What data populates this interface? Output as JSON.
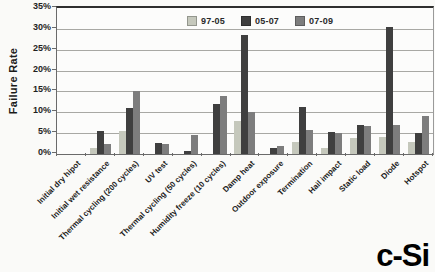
{
  "figure": {
    "corner_label": "c-Si"
  },
  "chart_data": {
    "type": "bar",
    "title": "",
    "xlabel": "",
    "ylabel": "Failure Rate",
    "ylim": [
      0,
      35
    ],
    "ytick_step": 5,
    "ytick_suffix": "%",
    "grid": true,
    "legend_position": "top-center-inside",
    "categories": [
      "Initial dry hipot",
      "Initial wet resistance",
      "Thermal cycling (200 cycles)",
      "UV test",
      "Thermal cycling (50 cycles)",
      "Humidity freeze (10 cycles)",
      "Damp heat",
      "Outdoor exposure",
      "Termination",
      "Hail impact",
      "Static load",
      "Diode",
      "Hotspot"
    ],
    "series": [
      {
        "name": "97-05",
        "color": "#c5c8bc",
        "values": [
          0,
          1.5,
          5.5,
          0,
          0,
          0,
          7.8,
          0,
          3,
          1.5,
          3.8,
          4,
          3
        ]
      },
      {
        "name": "05-07",
        "color": "#3f3f3f",
        "values": [
          0,
          5.5,
          11,
          2.7,
          0.7,
          12,
          28.5,
          1.5,
          11.3,
          5.3,
          7,
          30.5,
          5
        ]
      },
      {
        "name": "07-09",
        "color": "#7d7d7d",
        "values": [
          0,
          2.5,
          15,
          2.3,
          4.5,
          14,
          10,
          2,
          5.8,
          5,
          6.8,
          7,
          9
        ]
      }
    ]
  }
}
